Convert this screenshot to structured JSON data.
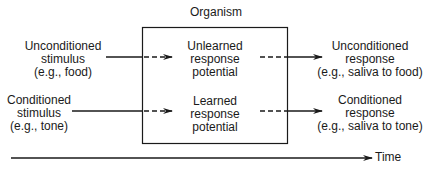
{
  "diagram": {
    "organism_label": "Organism",
    "inputs": [
      {
        "lines": [
          "Unconditioned",
          "stimulus",
          "(e.g.,  food)"
        ]
      },
      {
        "lines": [
          "Conditioned",
          "stimulus",
          "(e.g.,  tone)"
        ]
      }
    ],
    "potentials": [
      {
        "lines": [
          "Unlearned",
          "response",
          "potential"
        ]
      },
      {
        "lines": [
          "Learned",
          "response",
          "potential"
        ]
      }
    ],
    "outputs": [
      {
        "lines": [
          "Unconditioned",
          "response",
          "(e.g.,  saliva to food)"
        ]
      },
      {
        "lines": [
          "Conditioned",
          "response",
          "(e.g.,  saliva to tone)"
        ]
      }
    ],
    "time_label": "Time",
    "colors": {
      "line": "#1a1a1a",
      "background": "#ffffff"
    }
  }
}
